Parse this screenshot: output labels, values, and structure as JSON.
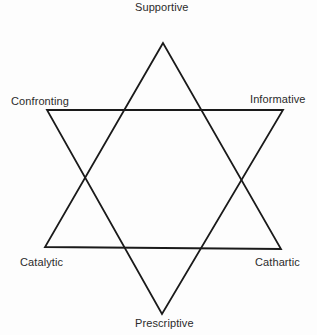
{
  "diagram": {
    "type": "six-category hexagram",
    "stroke_color": "#1a1a1a",
    "labels": {
      "top": "Supportive",
      "upper_left": "Confronting",
      "upper_right": "Informative",
      "lower_left": "Catalytic",
      "lower_right": "Cathartic",
      "bottom": "Prescriptive"
    },
    "triangles": [
      {
        "name": "upward",
        "vertices": [
          "Supportive",
          "Catalytic",
          "Cathartic"
        ]
      },
      {
        "name": "downward",
        "vertices": [
          "Confronting",
          "Informative",
          "Prescriptive"
        ]
      }
    ]
  }
}
